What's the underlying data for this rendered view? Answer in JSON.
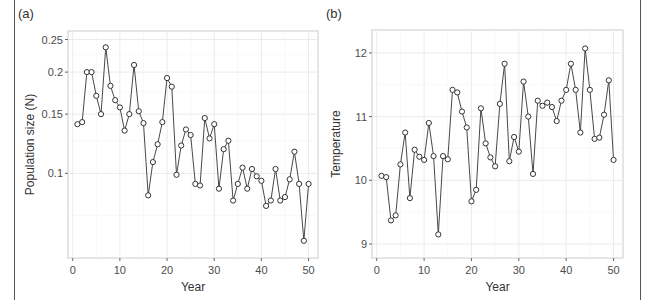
{
  "chart_data": [
    {
      "panel_label": "(a)",
      "type": "line",
      "xlabel": "Year",
      "ylabel": "Population size (N)",
      "yscale": "log",
      "xlim": [
        -1,
        52
      ],
      "ylim": [
        0.056,
        0.265
      ],
      "xticks": [
        0,
        10,
        20,
        30,
        40,
        50
      ],
      "yticks": [
        0.1,
        0.15,
        0.2,
        0.25
      ],
      "ytick_labels": [
        "0.1",
        "0.15",
        "0.2",
        "0.25"
      ],
      "grid": true,
      "markers": "open-circle",
      "x": [
        1,
        2,
        3,
        4,
        5,
        6,
        7,
        8,
        9,
        10,
        11,
        12,
        13,
        14,
        15,
        16,
        17,
        18,
        19,
        20,
        21,
        22,
        23,
        24,
        25,
        26,
        27,
        28,
        29,
        30,
        31,
        32,
        33,
        34,
        35,
        36,
        37,
        38,
        39,
        40,
        41,
        42,
        43,
        44,
        45,
        46,
        47,
        48,
        49,
        50
      ],
      "values": [
        0.14,
        0.142,
        0.2,
        0.2,
        0.17,
        0.15,
        0.237,
        0.182,
        0.165,
        0.157,
        0.134,
        0.15,
        0.21,
        0.153,
        0.141,
        0.086,
        0.108,
        0.122,
        0.142,
        0.192,
        0.181,
        0.099,
        0.121,
        0.135,
        0.13,
        0.093,
        0.092,
        0.146,
        0.127,
        0.14,
        0.09,
        0.118,
        0.125,
        0.083,
        0.093,
        0.104,
        0.09,
        0.103,
        0.098,
        0.095,
        0.08,
        0.083,
        0.103,
        0.083,
        0.085,
        0.096,
        0.116,
        0.093,
        0.063,
        0.093
      ]
    },
    {
      "panel_label": "(b)",
      "type": "line",
      "xlabel": "Year",
      "ylabel": "Temperature",
      "yscale": "linear",
      "xlim": [
        -1,
        52
      ],
      "ylim": [
        8.78,
        12.36
      ],
      "xticks": [
        0,
        10,
        20,
        30,
        40,
        50
      ],
      "yticks": [
        9,
        10,
        11,
        12
      ],
      "ytick_labels": [
        "9",
        "10",
        "11",
        "12"
      ],
      "grid": true,
      "markers": "open-circle",
      "x": [
        1,
        2,
        3,
        4,
        5,
        6,
        7,
        8,
        9,
        10,
        11,
        12,
        13,
        14,
        15,
        16,
        17,
        18,
        19,
        20,
        21,
        22,
        23,
        24,
        25,
        26,
        27,
        28,
        29,
        30,
        31,
        32,
        33,
        34,
        35,
        36,
        37,
        38,
        39,
        40,
        41,
        42,
        43,
        44,
        45,
        46,
        47,
        48,
        49,
        50
      ],
      "values": [
        10.07,
        10.05,
        9.37,
        9.45,
        10.25,
        10.75,
        9.72,
        10.48,
        10.37,
        10.32,
        10.9,
        10.38,
        9.15,
        10.38,
        10.33,
        11.42,
        11.38,
        11.08,
        10.83,
        9.67,
        9.85,
        11.13,
        10.58,
        10.36,
        10.22,
        11.2,
        11.83,
        10.3,
        10.68,
        10.45,
        11.55,
        11.0,
        10.1,
        11.25,
        11.17,
        11.22,
        11.15,
        10.93,
        11.25,
        11.42,
        11.83,
        11.42,
        10.75,
        12.07,
        11.42,
        10.65,
        10.67,
        11.03,
        11.57,
        10.32
      ]
    }
  ],
  "colors": {
    "line": "#333333",
    "marker_edge": "#333333",
    "marker_fill": "#ffffff",
    "grid": "#ebebeb",
    "panel_border": "#cccccc",
    "text": "#333333",
    "tick_text": "#4d4d4d"
  }
}
